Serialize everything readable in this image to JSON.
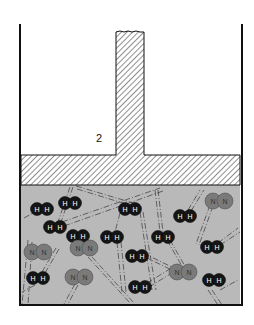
{
  "figure": {
    "label": "2",
    "colors": {
      "wall": "#111111",
      "gas_fill": "#b9b9b9",
      "h2_fill": "#151515",
      "n2_fill": "#7a7a7a",
      "hatch": "#444444"
    },
    "molecules": [
      {
        "type": "H2",
        "x": 42,
        "y": 209,
        "a1": "H",
        "a2": "H"
      },
      {
        "type": "H2",
        "x": 70,
        "y": 203,
        "a1": "H",
        "a2": "H"
      },
      {
        "type": "H2",
        "x": 55,
        "y": 227,
        "a1": "H",
        "a2": "H"
      },
      {
        "type": "H2",
        "x": 130,
        "y": 209,
        "a1": "H",
        "a2": "H"
      },
      {
        "type": "H2",
        "x": 185,
        "y": 216,
        "a1": "H",
        "a2": "H"
      },
      {
        "type": "H2",
        "x": 112,
        "y": 237,
        "a1": "H",
        "a2": "H"
      },
      {
        "type": "H2",
        "x": 163,
        "y": 237,
        "a1": "H",
        "a2": "H"
      },
      {
        "type": "H2",
        "x": 137,
        "y": 256,
        "a1": "H",
        "a2": "H"
      },
      {
        "type": "H2",
        "x": 212,
        "y": 247,
        "a1": "H",
        "a2": "H"
      },
      {
        "type": "H2",
        "x": 38,
        "y": 278,
        "a1": "H",
        "a2": "H"
      },
      {
        "type": "H2",
        "x": 140,
        "y": 287,
        "a1": "H",
        "a2": "H"
      },
      {
        "type": "H2",
        "x": 214,
        "y": 280,
        "a1": "H",
        "a2": "H"
      },
      {
        "type": "H2",
        "x": 78,
        "y": 236,
        "a1": "H",
        "a2": "H"
      },
      {
        "type": "N2",
        "x": 219,
        "y": 201,
        "a1": "N",
        "a2": "N"
      },
      {
        "type": "N2",
        "x": 38,
        "y": 252,
        "a1": "N",
        "a2": "N"
      },
      {
        "type": "N2",
        "x": 84,
        "y": 248,
        "a1": "N",
        "a2": "N"
      },
      {
        "type": "N2",
        "x": 79,
        "y": 277,
        "a1": "N",
        "a2": "N"
      },
      {
        "type": "N2",
        "x": 183,
        "y": 272,
        "a1": "N",
        "a2": "N"
      }
    ]
  }
}
